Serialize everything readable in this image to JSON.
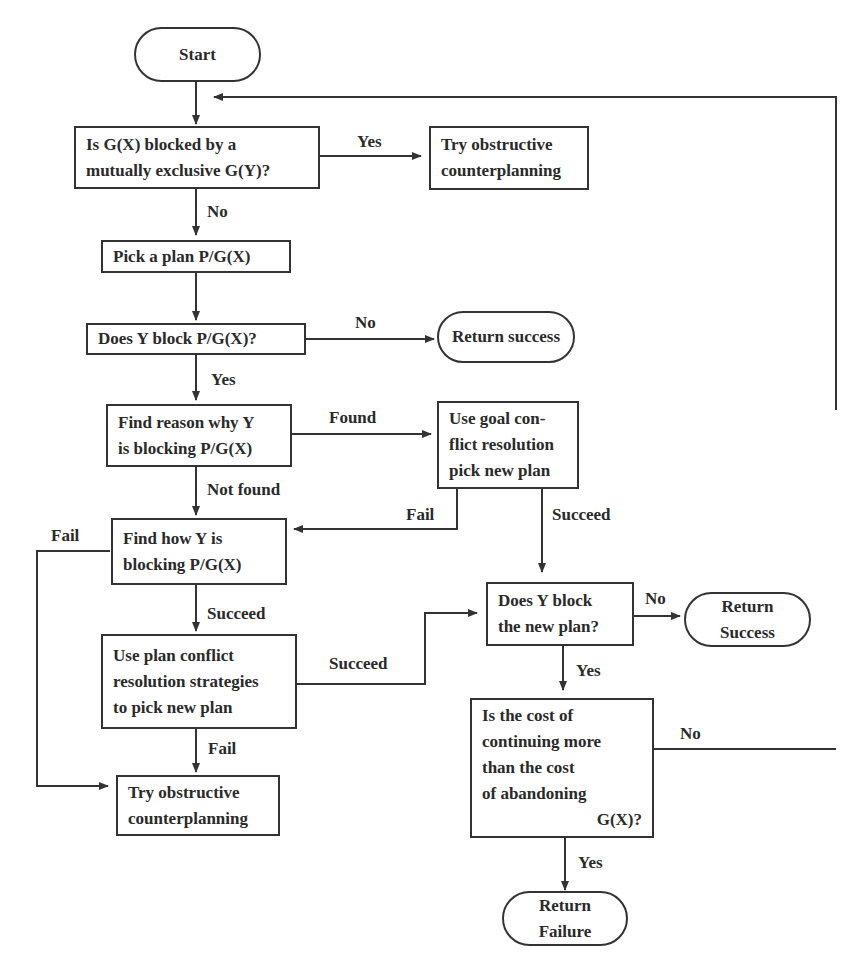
{
  "diagram": {
    "type": "flowchart",
    "nodes": {
      "start": {
        "lines": [
          "Start"
        ]
      },
      "q_blocked": {
        "lines": [
          "Is G(X) blocked by a",
          "mutually exclusive G(Y)?"
        ]
      },
      "try_obstructive_top": {
        "lines": [
          "Try obstructive",
          "counterplanning"
        ]
      },
      "pick_plan": {
        "lines": [
          "Pick a plan P/G(X)"
        ]
      },
      "q_y_block": {
        "lines": [
          "Does Y block P/G(X)?"
        ]
      },
      "return_success_1": {
        "lines": [
          "Return success"
        ]
      },
      "find_reason": {
        "lines": [
          "Find reason why Y",
          "is blocking P/G(X)"
        ]
      },
      "goal_conflict": {
        "lines": [
          "Use goal con-",
          "flict resolution",
          "pick new plan"
        ]
      },
      "find_how": {
        "lines": [
          "Find how Y is",
          "blocking P/G(X)"
        ]
      },
      "plan_conflict": {
        "lines": [
          "Use plan conflict",
          "resolution strategies",
          "to pick new plan"
        ]
      },
      "try_obstructive_bottom": {
        "lines": [
          "Try obstructive",
          "counterplanning"
        ]
      },
      "q_new_plan": {
        "lines": [
          "Does Y block",
          "the new plan?"
        ]
      },
      "return_success_2": {
        "lines": [
          "Return",
          "Success"
        ]
      },
      "q_cost": {
        "lines": [
          "Is the cost of",
          "continuing more",
          "than the cost",
          "of abandoning",
          "G(X)?"
        ]
      },
      "return_failure": {
        "lines": [
          "Return",
          "Failure"
        ]
      }
    },
    "edge_labels": {
      "blocked_yes": "Yes",
      "blocked_no": "No",
      "y_block_no": "No",
      "y_block_yes": "Yes",
      "reason_found": "Found",
      "reason_not_found": "Not found",
      "goal_fail": "Fail",
      "goal_succeed": "Succeed",
      "how_fail": "Fail",
      "how_succeed": "Succeed",
      "plan_succeed": "Succeed",
      "plan_fail": "Fail",
      "new_plan_no": "No",
      "new_plan_yes": "Yes",
      "cost_no": "No",
      "cost_yes": "Yes"
    },
    "edges": [
      [
        "start",
        "q_blocked",
        ""
      ],
      [
        "q_blocked",
        "try_obstructive_top",
        "Yes"
      ],
      [
        "q_blocked",
        "pick_plan",
        "No"
      ],
      [
        "pick_plan",
        "q_y_block",
        ""
      ],
      [
        "q_y_block",
        "return_success_1",
        "No"
      ],
      [
        "q_y_block",
        "find_reason",
        "Yes"
      ],
      [
        "find_reason",
        "goal_conflict",
        "Found"
      ],
      [
        "find_reason",
        "find_how",
        "Not found"
      ],
      [
        "goal_conflict",
        "find_how",
        "Fail"
      ],
      [
        "goal_conflict",
        "q_new_plan",
        "Succeed"
      ],
      [
        "find_how",
        "try_obstructive_bottom",
        "Fail"
      ],
      [
        "find_how",
        "plan_conflict",
        "Succeed"
      ],
      [
        "plan_conflict",
        "q_new_plan",
        "Succeed"
      ],
      [
        "plan_conflict",
        "try_obstructive_bottom",
        "Fail"
      ],
      [
        "q_new_plan",
        "return_success_2",
        "No"
      ],
      [
        "q_new_plan",
        "q_cost",
        "Yes"
      ],
      [
        "q_cost",
        "q_blocked",
        "No"
      ],
      [
        "q_cost",
        "return_failure",
        "Yes"
      ]
    ]
  }
}
